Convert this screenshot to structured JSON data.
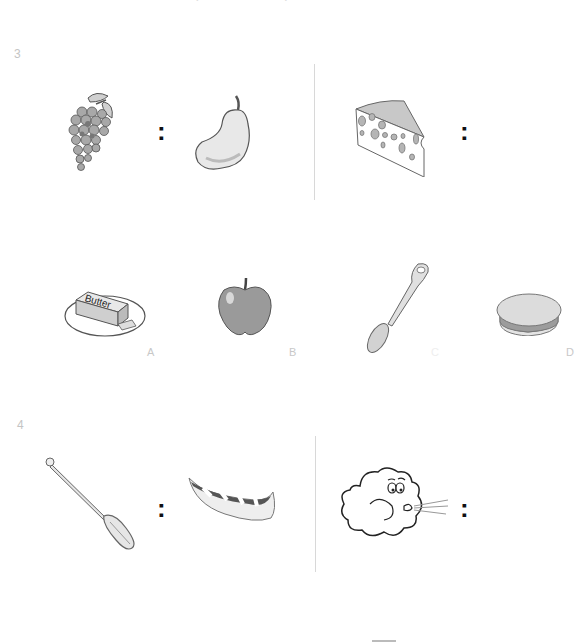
{
  "page": {
    "header_partial_text": "· ·",
    "questions": [
      {
        "number": "3",
        "analogy": {
          "left_pair": [
            {
              "name": "grapes",
              "icon": "grapes-icon"
            },
            {
              "name": "pear",
              "icon": "pear-icon"
            }
          ],
          "separator": ":",
          "right_pair": [
            {
              "name": "cheese",
              "icon": "cheese-icon"
            }
          ],
          "right_separator": ":"
        },
        "options": [
          {
            "label": "A",
            "name": "butter",
            "icon": "butter-icon",
            "text": "Butter"
          },
          {
            "label": "B",
            "name": "apple",
            "icon": "apple-icon"
          },
          {
            "label": "C",
            "name": "spoon",
            "icon": "spoon-icon"
          },
          {
            "label": "D",
            "name": "pie",
            "icon": "pie-icon"
          }
        ]
      },
      {
        "number": "4",
        "analogy": {
          "left_pair": [
            {
              "name": "paddle",
              "icon": "paddle-icon"
            },
            {
              "name": "canoe",
              "icon": "canoe-icon"
            }
          ],
          "separator": ":",
          "right_pair": [
            {
              "name": "wind-cloud",
              "icon": "wind-cloud-icon"
            }
          ],
          "right_separator": ":"
        }
      }
    ]
  }
}
